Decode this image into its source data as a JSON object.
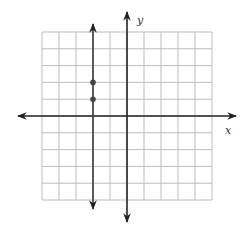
{
  "chart_data": {
    "type": "scatter",
    "title": "",
    "xlabel": "x",
    "ylabel": "y",
    "xlim": [
      -5,
      5
    ],
    "ylim": [
      -5,
      5
    ],
    "grid": true,
    "grid_step": 1,
    "lines": [
      {
        "type": "vertical",
        "equation": "x = -2",
        "x": -2,
        "arrows": "both"
      }
    ],
    "points": [
      {
        "x": -2,
        "y": 2
      },
      {
        "x": -2,
        "y": 1
      }
    ]
  },
  "labels": {
    "x_axis": "x",
    "y_axis": "y"
  },
  "colors": {
    "grid": "#bdbdbd",
    "axis": "#222222",
    "line": "#3a3a3a",
    "point": "#444444"
  }
}
